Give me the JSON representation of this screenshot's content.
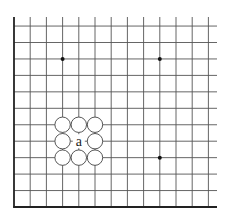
{
  "diagram": {
    "type": "go-board-corner",
    "corner": "lower-left",
    "grid": {
      "columns_visible": 13,
      "rows_visible": 12,
      "origin_x": 14,
      "origin_y": 207,
      "spacing_x": 16.2,
      "spacing_y": 16.45,
      "extend_right_to": 217,
      "extend_top_to": 17,
      "line_color": "#555555",
      "edge_color": "#222222"
    },
    "star_points": [
      {
        "col": 3,
        "row": 9
      },
      {
        "col": 9,
        "row": 9
      },
      {
        "col": 9,
        "row": 3
      }
    ],
    "empty_circles": [
      {
        "col": 3,
        "row": 5
      },
      {
        "col": 4,
        "row": 5
      },
      {
        "col": 5,
        "row": 5
      },
      {
        "col": 3,
        "row": 4
      },
      {
        "col": 5,
        "row": 4
      },
      {
        "col": 3,
        "row": 3
      },
      {
        "col": 4,
        "row": 3
      },
      {
        "col": 5,
        "row": 3
      }
    ],
    "labels": [
      {
        "col": 4,
        "row": 4,
        "text": "a"
      }
    ]
  }
}
